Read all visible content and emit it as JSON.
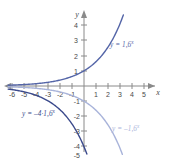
{
  "figure": {
    "name": "exponential-functions-graph",
    "background": "#ffffff"
  },
  "axes": {
    "x_name": "x",
    "y_name": "y",
    "x_ticks": [
      "-6",
      "-5",
      "-4",
      "-3",
      "-2",
      "-1",
      "1",
      "2",
      "3",
      "4",
      "5"
    ],
    "y_ticks": [
      "4",
      "3",
      "2",
      "1",
      "-1",
      "-2",
      "-3",
      "-4",
      "-5"
    ],
    "axis_color": "#8a8a8a",
    "label_color": "#4a4a4a"
  },
  "labels": {
    "growth": {
      "text": "y = 1,6",
      "exponent": "x",
      "color": "#5566a8"
    },
    "scaled": {
      "text": "y = –4·1,6",
      "exponent": "x",
      "color": "#3b4a8c"
    },
    "reflected": {
      "text": "y = –1,6",
      "exponent": "x",
      "color": "#a9b4da"
    }
  },
  "chart_data": {
    "type": "line",
    "title": "",
    "xlabel": "x",
    "ylabel": "y",
    "xlim": [
      -6.5,
      5.8
    ],
    "ylim": [
      -5.4,
      4.4
    ],
    "grid": false,
    "legend": "inline-annotations",
    "xticks": [
      -6,
      -5,
      -4,
      -3,
      -2,
      -1,
      1,
      2,
      3,
      4,
      5
    ],
    "yticks": [
      4,
      3,
      2,
      1,
      -1,
      -2,
      -3,
      -4,
      -5
    ],
    "x": [
      -6,
      -5,
      -4,
      -3,
      -2,
      -1,
      0,
      1,
      2,
      3
    ],
    "series": [
      {
        "name": "y = 1,6^x",
        "color": "#5566a8",
        "formula": "y = 1.6^x",
        "base": 1.6,
        "factor": 1,
        "values": [
          0.0596,
          0.0954,
          0.1526,
          0.2441,
          0.3906,
          0.625,
          1,
          1.6,
          2.56,
          4.096
        ]
      },
      {
        "name": "y = -1,6^x",
        "color": "#a9b4da",
        "formula": "y = -1.6^x",
        "base": 1.6,
        "factor": -1,
        "values": [
          -0.0596,
          -0.0954,
          -0.1526,
          -0.2441,
          -0.3906,
          -0.625,
          -1,
          -1.6,
          -2.56,
          -4.096
        ]
      },
      {
        "name": "y = -4·1,6^x",
        "color": "#3b4a8c",
        "formula": "y = -4 * 1.6^x",
        "base": 1.6,
        "factor": -4,
        "values": [
          -0.2384,
          -0.3815,
          -0.6104,
          -0.9766,
          -1.5625,
          -2.5,
          -4,
          -6.4,
          -10.24,
          -16.384
        ]
      }
    ]
  }
}
